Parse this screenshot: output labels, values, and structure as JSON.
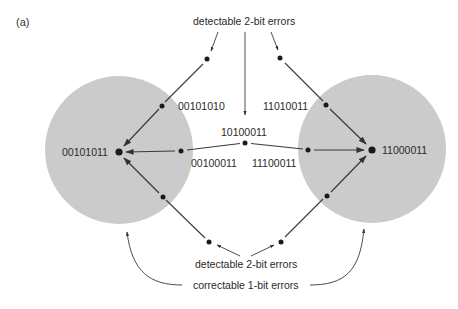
{
  "panel_label": "(a)",
  "codewords": {
    "left": "00101011",
    "right": "11000011"
  },
  "neighbors": {
    "left_upper": "00101010",
    "left_middle": "00100011",
    "center": "10100011",
    "right_middle": "11100011",
    "right_upper": "11010011"
  },
  "annotations": {
    "top": "detectable 2-bit errors",
    "bottom_detectable": "detectable 2-bit errors",
    "bottom_correctable": "correctable 1-bit errors"
  },
  "colors": {
    "sphere_fill": "#cbcbcb",
    "line": "#3a3a3a",
    "node": "#1a1a1a",
    "text": "#2a2a2a"
  }
}
